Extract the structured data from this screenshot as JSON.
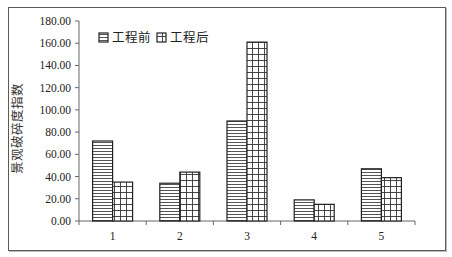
{
  "chart_data": {
    "type": "bar",
    "title": "",
    "xlabel": "",
    "ylabel": "景观破碎度指数",
    "categories": [
      "1",
      "2",
      "3",
      "4",
      "5"
    ],
    "series": [
      {
        "name": "工程前",
        "pattern": "horizontal-lines",
        "values": [
          72,
          34,
          90,
          19,
          47
        ]
      },
      {
        "name": "工程后",
        "pattern": "grid",
        "values": [
          35,
          44,
          161,
          15,
          39
        ]
      }
    ],
    "ylim": [
      0,
      180
    ],
    "yticks": [
      "0.00",
      "20.00",
      "40.00",
      "60.00",
      "80.00",
      "100.00",
      "120.00",
      "140.00",
      "160.00",
      "180.00"
    ],
    "grid": false,
    "legend_position": "top-left-inside"
  }
}
